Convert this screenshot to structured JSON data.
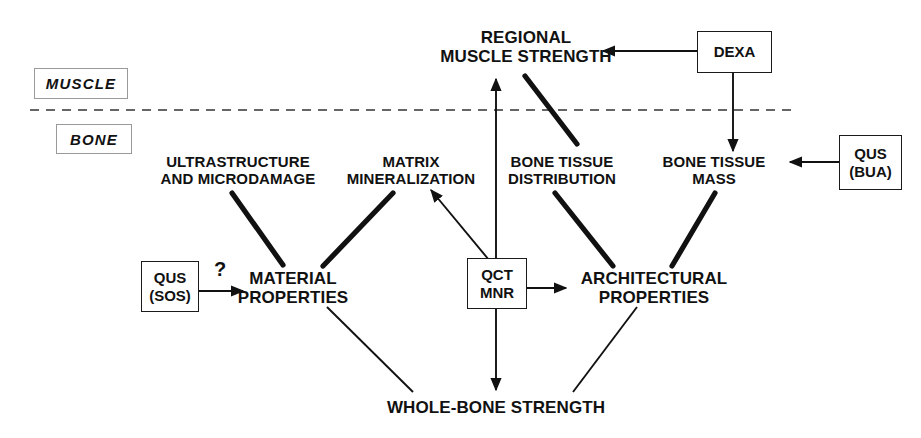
{
  "figure": {
    "type": "concept-diagram",
    "title_visible": false,
    "background_color": "#ffffff",
    "ink_color": "#111111"
  },
  "regions": [
    {
      "id": "muscle",
      "label": "MUSCLE",
      "x": 34,
      "y": 68,
      "w": 92,
      "h": 29
    },
    {
      "id": "bone",
      "label": "BONE",
      "x": 56,
      "y": 124,
      "w": 74,
      "h": 28
    }
  ],
  "divider": {
    "name": "muscle-bone-divider",
    "style": "dashed",
    "x1": 30,
    "x2": 792,
    "y": 110,
    "color": "#333333"
  },
  "nodes": [
    {
      "id": "regional-muscle-strength",
      "label": "REGIONAL\nMUSCLE STRENGTH",
      "level": "top",
      "cx": 526,
      "cy": 52,
      "w": 250
    },
    {
      "id": "ultrastructure-microdamage",
      "label": "ULTRASTRUCTURE\nAND MICRODAMAGE",
      "level": "concept",
      "cx": 238,
      "cy": 172,
      "w": 210
    },
    {
      "id": "matrix-mineralization",
      "label": "MATRIX\nMINERALIZATION",
      "level": "concept",
      "cx": 411,
      "cy": 172,
      "w": 170
    },
    {
      "id": "bone-tissue-distribution",
      "label": "BONE TISSUE\nDISTRIBUTION",
      "level": "concept",
      "cx": 562,
      "cy": 172,
      "w": 160
    },
    {
      "id": "bone-tissue-mass",
      "label": "BONE TISSUE\nMASS",
      "level": "concept",
      "cx": 714,
      "cy": 172,
      "w": 150
    },
    {
      "id": "material-properties",
      "label": "MATERIAL\nPROPERTIES",
      "level": "main",
      "cx": 293,
      "cy": 290,
      "w": 180
    },
    {
      "id": "architectural-properties",
      "label": "ARCHITECTURAL\nPROPERTIES",
      "level": "main",
      "cx": 654,
      "cy": 290,
      "w": 210
    },
    {
      "id": "whole-bone-strength",
      "label": "WHOLE-BONE STRENGTH",
      "level": "main",
      "cx": 496,
      "cy": 408,
      "w": 300
    }
  ],
  "devices": [
    {
      "id": "qus-sos",
      "label": "QUS\n(SOS)",
      "x": 141,
      "y": 261,
      "w": 56,
      "h": 49
    },
    {
      "id": "qct-mnr",
      "label": "QCT\nMNR",
      "x": 467,
      "y": 258,
      "w": 58,
      "h": 49
    },
    {
      "id": "dexa",
      "label": "DEXA",
      "x": 697,
      "y": 31,
      "w": 73,
      "h": 40
    },
    {
      "id": "qus-bua",
      "label": "QUS\n(BUA)",
      "x": 839,
      "y": 135,
      "w": 61,
      "h": 53
    }
  ],
  "annotations": [
    {
      "id": "uncertainty-question-mark",
      "text": "?",
      "x": 214,
      "y": 258
    }
  ],
  "edges": [
    {
      "id": "ultrastructure-to-material",
      "from": "ultrastructure-microdamage",
      "to": "material-properties",
      "weight": "thick",
      "arrow": false
    },
    {
      "id": "matrix-to-material",
      "from": "matrix-mineralization",
      "to": "material-properties",
      "weight": "thick",
      "arrow": false
    },
    {
      "id": "bone-distribution-to-architectural",
      "from": "bone-tissue-distribution",
      "to": "architectural-properties",
      "weight": "thick",
      "arrow": false
    },
    {
      "id": "bone-mass-to-architectural",
      "from": "bone-tissue-mass",
      "to": "architectural-properties",
      "weight": "thick",
      "arrow": false
    },
    {
      "id": "distribution-to-muscle-strength",
      "from": "bone-tissue-distribution",
      "to": "regional-muscle-strength",
      "weight": "thick",
      "arrow": false
    },
    {
      "id": "material-to-whole-bone",
      "from": "material-properties",
      "to": "whole-bone-strength",
      "weight": "thin",
      "arrow": false
    },
    {
      "id": "architectural-to-whole-bone",
      "from": "architectural-properties",
      "to": "whole-bone-strength",
      "weight": "thin",
      "arrow": false
    },
    {
      "id": "qct-to-muscle-strength",
      "from": "qct-mnr",
      "to": "regional-muscle-strength",
      "weight": "thin",
      "arrow": true
    },
    {
      "id": "qct-to-whole-bone",
      "from": "qct-mnr",
      "to": "whole-bone-strength",
      "weight": "thin",
      "arrow": true
    },
    {
      "id": "qct-to-matrix",
      "from": "qct-mnr",
      "to": "matrix-mineralization",
      "weight": "thin",
      "arrow": true
    },
    {
      "id": "qct-to-architectural",
      "from": "qct-mnr",
      "to": "architectural-properties",
      "weight": "thin",
      "arrow": true
    },
    {
      "id": "qus-sos-to-material",
      "from": "qus-sos",
      "to": "material-properties",
      "weight": "thin",
      "arrow": true
    },
    {
      "id": "dexa-to-muscle-strength",
      "from": "dexa",
      "to": "regional-muscle-strength",
      "weight": "thin",
      "arrow": true
    },
    {
      "id": "dexa-to-bone-mass",
      "from": "dexa",
      "to": "bone-tissue-mass",
      "weight": "thin",
      "arrow": true
    },
    {
      "id": "qus-bua-to-bone-mass",
      "from": "qus-bua",
      "to": "bone-tissue-mass",
      "weight": "thin",
      "arrow": true
    }
  ]
}
